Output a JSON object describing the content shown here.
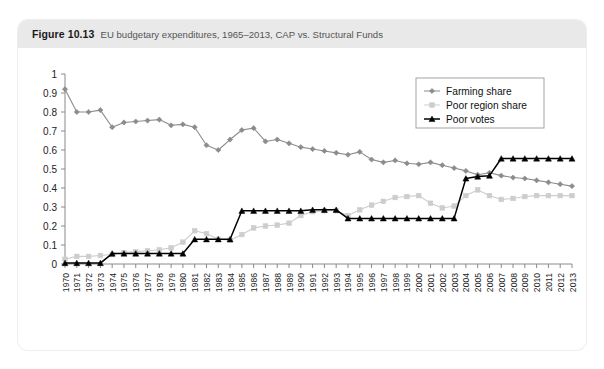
{
  "figure": {
    "number": "Figure 10.13",
    "caption": "EU budgetary expenditures, 1965–2013, CAP vs. Structural Funds"
  },
  "chart_data": {
    "type": "line",
    "title": "EU budgetary expenditures, 1965–2013, CAP vs. Structural Funds",
    "xlabel": "",
    "ylabel": "",
    "ylim": [
      0,
      1
    ],
    "yticks": [
      "0",
      "0.1",
      "0.2",
      "0.3",
      "0.4",
      "0.5",
      "0.6",
      "0.7",
      "0.8",
      "0.9",
      "1"
    ],
    "grid": false,
    "legend_position": "top-right",
    "categories": [
      "1970",
      "1971",
      "1972",
      "1973",
      "1974",
      "1975",
      "1976",
      "1977",
      "1978",
      "1979",
      "1980",
      "1981",
      "1982",
      "1983",
      "1984",
      "1985",
      "1986",
      "1987",
      "1988",
      "1989",
      "1990",
      "1991",
      "1992",
      "1993",
      "1994",
      "1995",
      "1996",
      "1997",
      "1998",
      "1999",
      "2000",
      "2001",
      "2002",
      "2003",
      "2004",
      "2005",
      "2006",
      "2007",
      "2008",
      "2009",
      "2010",
      "2011",
      "2012",
      "2013"
    ],
    "series": [
      {
        "name": "Farming share",
        "color": "#8c8c8c",
        "marker": "diamond",
        "values": [
          0.92,
          0.8,
          0.8,
          0.81,
          0.72,
          0.745,
          0.75,
          0.755,
          0.76,
          0.73,
          0.735,
          0.72,
          0.625,
          0.6,
          0.655,
          0.705,
          0.715,
          0.645,
          0.655,
          0.635,
          0.615,
          0.605,
          0.595,
          0.585,
          0.575,
          0.59,
          0.55,
          0.535,
          0.545,
          0.53,
          0.525,
          0.535,
          0.52,
          0.505,
          0.49,
          0.47,
          0.48,
          0.465,
          0.455,
          0.45,
          0.44,
          0.43,
          0.42,
          0.41
        ]
      },
      {
        "name": "Poor region share",
        "color": "#cdcdcd",
        "marker": "square",
        "values": [
          0.025,
          0.04,
          0.04,
          0.045,
          0.05,
          0.06,
          0.065,
          0.07,
          0.075,
          0.085,
          0.115,
          0.175,
          0.16,
          0.13,
          0.125,
          0.155,
          0.19,
          0.2,
          0.205,
          0.215,
          0.255,
          0.275,
          0.28,
          0.28,
          0.255,
          0.285,
          0.31,
          0.33,
          0.35,
          0.355,
          0.36,
          0.32,
          0.295,
          0.305,
          0.36,
          0.39,
          0.36,
          0.34,
          0.345,
          0.355,
          0.36,
          0.36,
          0.36,
          0.36
        ]
      },
      {
        "name": "Poor votes",
        "color": "#000000",
        "marker": "triangle",
        "values": [
          0.005,
          0.005,
          0.005,
          0.005,
          0.055,
          0.055,
          0.055,
          0.055,
          0.055,
          0.055,
          0.055,
          0.13,
          0.13,
          0.13,
          0.13,
          0.28,
          0.28,
          0.28,
          0.28,
          0.28,
          0.28,
          0.285,
          0.285,
          0.285,
          0.24,
          0.24,
          0.24,
          0.24,
          0.24,
          0.24,
          0.24,
          0.24,
          0.24,
          0.24,
          0.45,
          0.46,
          0.465,
          0.555,
          0.555,
          0.555,
          0.555,
          0.555,
          0.555,
          0.555
        ]
      }
    ]
  }
}
